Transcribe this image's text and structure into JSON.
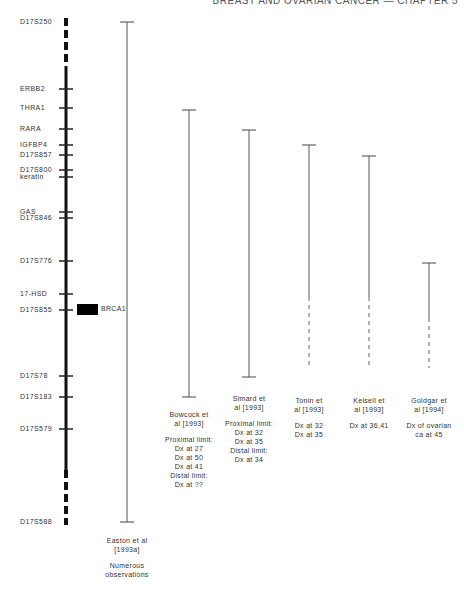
{
  "header": {
    "text": "BREAST AND OVARIAN CANCER — CHAPTER 5"
  },
  "chromosome": {
    "markers": [
      {
        "name": "D17S250",
        "y": 22
      },
      {
        "name": "ERBB2",
        "y": 89
      },
      {
        "name": "THRA1",
        "y": 108
      },
      {
        "name": "RARA",
        "y": 129
      },
      {
        "name": "IGFBP4",
        "y": 145
      },
      {
        "name": "D17S857",
        "y": 155
      },
      {
        "name": "D17S800",
        "y": 170
      },
      {
        "name": "keratin",
        "y": 177
      },
      {
        "name": "GAS",
        "y": 212
      },
      {
        "name": "D17S846",
        "y": 218
      },
      {
        "name": "D17S776",
        "y": 261
      },
      {
        "name": "17-HSD",
        "y": 294
      },
      {
        "name": "D17S855",
        "y": 310
      },
      {
        "name": "D17S78",
        "y": 376
      },
      {
        "name": "D17S183",
        "y": 397
      },
      {
        "name": "D17S579",
        "y": 429
      },
      {
        "name": "D17S588",
        "y": 522
      }
    ],
    "gene": {
      "name": "BRCA1",
      "y": 310
    }
  },
  "studies": [
    {
      "id": "easton",
      "x": 127,
      "top": 22,
      "solid_bottom": 522,
      "dashed_bottom": null,
      "citation": "Easton et al\n[1993a]",
      "note": "Numerous\nobservations",
      "label_y": 536
    },
    {
      "id": "bowcock",
      "x": 189,
      "top": 110,
      "solid_bottom": 397,
      "dashed_bottom": null,
      "citation": "Bowcock et\nal [1993]",
      "note": "Proximal limit:\nDx at 27\nDx at 50\nDx at 41\nDistal limit:\nDx at ??",
      "label_y": 410
    },
    {
      "id": "simard",
      "x": 249,
      "top": 130,
      "solid_bottom": 377,
      "dashed_bottom": null,
      "citation": "Simard et\nal [1993]",
      "note": "Proximal limit:\nDx at 32\nDx at 35\nDistal limit:\nDx at 34",
      "label_y": 394
    },
    {
      "id": "tonin",
      "x": 309,
      "top": 145,
      "solid_bottom": 297,
      "dashed_bottom": 368,
      "citation": "Tonin et\nal [1993]",
      "note": "Dx at 32\nDx at 35",
      "label_y": 396
    },
    {
      "id": "kelsell",
      "x": 369,
      "top": 156,
      "solid_bottom": 297,
      "dashed_bottom": 368,
      "citation": "Kelsell et\nal [1993]",
      "note": "Dx at 36,41",
      "label_y": 396
    },
    {
      "id": "goldgar",
      "x": 429,
      "top": 263,
      "solid_bottom": 318,
      "dashed_bottom": 368,
      "citation": "Goldgar et\nal [1994]",
      "note": "Dx of ovarian\nca at 45",
      "label_y": 396
    }
  ]
}
